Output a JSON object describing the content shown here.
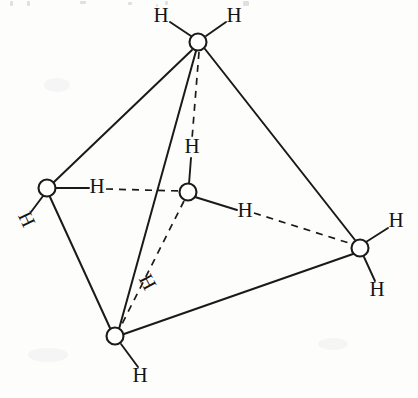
{
  "figure": {
    "type": "molecular-structure-diagram",
    "background_color": "#fdfdfc",
    "line_color": "#1a1a1a",
    "canvas": {
      "width": 418,
      "height": 398
    }
  },
  "atoms": [
    {
      "id": "top",
      "label": "",
      "cx": 198,
      "cy": 42,
      "r": 8.5
    },
    {
      "id": "left",
      "label": "",
      "cx": 47,
      "cy": 188,
      "r": 8.5
    },
    {
      "id": "center",
      "label": "",
      "cx": 188,
      "cy": 192,
      "r": 8.5
    },
    {
      "id": "right",
      "label": "",
      "cx": 360,
      "cy": 248,
      "r": 8.5
    },
    {
      "id": "bottom",
      "label": "",
      "cx": 115,
      "cy": 336,
      "r": 8.5
    }
  ],
  "hydrogen_labels": [
    {
      "id": "h-top-left",
      "text": "H",
      "x": 161,
      "y": 17,
      "rotation": 0
    },
    {
      "id": "h-top-right",
      "text": "H",
      "x": 234,
      "y": 17,
      "rotation": 0
    },
    {
      "id": "h-left-outer",
      "text": "H",
      "x": 25,
      "y": 220,
      "rotation": 65
    },
    {
      "id": "h-left-inner",
      "text": "H",
      "x": 97,
      "y": 188,
      "rotation": 0
    },
    {
      "id": "h-center-top",
      "text": "H",
      "x": 192,
      "y": 148,
      "rotation": 0
    },
    {
      "id": "h-center-right",
      "text": "H",
      "x": 245,
      "y": 212,
      "rotation": 0
    },
    {
      "id": "h-center-lower",
      "text": "H",
      "x": 146,
      "y": 283,
      "rotation": 62
    },
    {
      "id": "h-right-upper",
      "text": "H",
      "x": 396,
      "y": 222,
      "rotation": 0
    },
    {
      "id": "h-right-lower",
      "text": "H",
      "x": 377,
      "y": 291,
      "rotation": 0
    },
    {
      "id": "h-bottom",
      "text": "H",
      "x": 140,
      "y": 377,
      "rotation": 0
    }
  ],
  "bonds": [
    {
      "id": "edge-top-left",
      "style": "solid",
      "from": "top",
      "to": "left",
      "x1": 192,
      "y1": 50,
      "x2": 54,
      "y2": 182
    },
    {
      "id": "edge-top-right",
      "style": "solid",
      "from": "top",
      "to": "right",
      "x1": 205,
      "y1": 49,
      "x2": 355,
      "y2": 240
    },
    {
      "id": "edge-top-bottom",
      "style": "solid",
      "from": "top",
      "to": "bottom",
      "x1": 196,
      "y1": 51,
      "x2": 119,
      "y2": 329
    },
    {
      "id": "edge-left-bottom",
      "style": "solid",
      "from": "left",
      "to": "bottom",
      "x1": 50,
      "y1": 197,
      "x2": 110,
      "y2": 328
    },
    {
      "id": "edge-bottom-right",
      "style": "solid",
      "from": "bottom",
      "to": "right",
      "x1": 124,
      "y1": 334,
      "x2": 353,
      "y2": 254
    },
    {
      "id": "bond-top-hl",
      "style": "solid",
      "from": "top",
      "to": "h-top-left",
      "x1": 191,
      "y1": 36,
      "x2": 170,
      "y2": 22
    },
    {
      "id": "bond-top-hr",
      "style": "solid",
      "from": "top",
      "to": "h-top-right",
      "x1": 206,
      "y1": 36,
      "x2": 226,
      "y2": 22
    },
    {
      "id": "bond-left-houter",
      "style": "solid",
      "from": "left",
      "to": "h-left-outer",
      "x1": 43,
      "y1": 196,
      "x2": 30,
      "y2": 213
    },
    {
      "id": "bond-left-hinner",
      "style": "solid",
      "from": "left",
      "to": "h-left-inner",
      "x1": 56,
      "y1": 188,
      "x2": 89,
      "y2": 188
    },
    {
      "id": "bond-center-htop",
      "style": "solid",
      "from": "center",
      "to": "h-center-top",
      "x1": 189,
      "y1": 184,
      "x2": 191,
      "y2": 157
    },
    {
      "id": "bond-center-hright",
      "style": "solid",
      "from": "center",
      "to": "h-center-right",
      "x1": 195,
      "y1": 197,
      "x2": 237,
      "y2": 210
    },
    {
      "id": "bond-right-hupper",
      "style": "solid",
      "from": "right",
      "to": "h-right-upper",
      "x1": 366,
      "y1": 242,
      "x2": 388,
      "y2": 228
    },
    {
      "id": "bond-right-hlower",
      "style": "solid",
      "from": "right",
      "to": "h-right-lower",
      "x1": 364,
      "y1": 257,
      "x2": 375,
      "y2": 281
    },
    {
      "id": "bond-bottom-h",
      "style": "solid",
      "from": "bottom",
      "to": "h-bottom",
      "x1": 121,
      "y1": 344,
      "x2": 138,
      "y2": 367
    },
    {
      "id": "hbond-top-center",
      "style": "dashed",
      "from": "top",
      "to": "h-center-top",
      "x1": 199,
      "y1": 52,
      "x2": 192,
      "y2": 139
    },
    {
      "id": "hbond-left-center",
      "style": "dashed",
      "from": "h-left-inner",
      "to": "center",
      "x1": 106,
      "y1": 189,
      "x2": 180,
      "y2": 191
    },
    {
      "id": "hbond-center-right",
      "style": "dashed",
      "from": "h-center-right",
      "to": "right",
      "x1": 254,
      "y1": 213,
      "x2": 352,
      "y2": 244
    },
    {
      "id": "hbond-center-bottom",
      "style": "dashed",
      "from": "center",
      "to": "bottom",
      "x1": 184,
      "y1": 201,
      "x2": 119,
      "y2": 330
    }
  ]
}
